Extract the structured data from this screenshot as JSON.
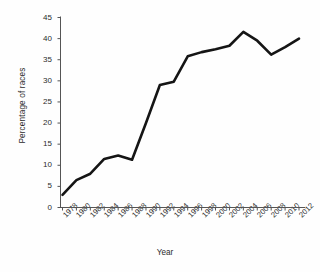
{
  "chart_data": {
    "type": "line",
    "title": "",
    "xlabel": "Year",
    "ylabel": "Percentage of races",
    "x": [
      1978,
      1980,
      1982,
      1984,
      1986,
      1988,
      1990,
      1992,
      1994,
      1996,
      1998,
      2000,
      2002,
      2004,
      2006,
      2008,
      2010,
      2012
    ],
    "categories": [
      "1978",
      "1980",
      "1982",
      "1984",
      "1986",
      "1988",
      "1990",
      "1992",
      "1994",
      "1996",
      "1998",
      "2000",
      "2002",
      "2004",
      "2006",
      "2008",
      "2010",
      "2012"
    ],
    "values": [
      3,
      6.5,
      8,
      11.5,
      12.3,
      11.3,
      20,
      29,
      29.8,
      35.8,
      36.8,
      37.5,
      38.3,
      41.6,
      39.5,
      36.2,
      38,
      40
    ],
    "series": [
      {
        "name": "Percentage of races",
        "color": "#151515",
        "values": [
          3,
          6.5,
          8,
          11.5,
          12.3,
          11.3,
          20,
          29,
          29.8,
          35.8,
          36.8,
          37.5,
          38.3,
          41.6,
          39.5,
          36.2,
          38,
          40
        ]
      }
    ],
    "ylim": [
      0,
      45
    ],
    "yticks": [
      0,
      5,
      10,
      15,
      20,
      25,
      30,
      35,
      40,
      45
    ],
    "ytick_labels": [
      "0",
      "5",
      "10",
      "15",
      "20",
      "25",
      "30",
      "35",
      "40",
      "45"
    ],
    "xlim": [
      1978,
      2012
    ],
    "grid": false,
    "legend": "none",
    "line_width": 2.6,
    "axis_color": "#555555",
    "background": "#ffffff"
  }
}
